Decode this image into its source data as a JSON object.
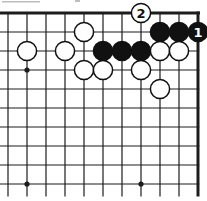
{
  "diagram": {
    "type": "go-board-corner-diagram",
    "colors": {
      "background": "#ffffff",
      "line": "#1c1c1c",
      "black_stone_fill": "#111111",
      "white_stone_fill": "#fefefe",
      "stone_outline": "#111111",
      "black_label_text": "#ffffff",
      "white_label_text": "#111111",
      "artifact_gray": "#bdbdbd"
    },
    "board": {
      "visible_cols": 11,
      "visible_rows": 10,
      "x0": 8,
      "y0": 13,
      "cell": 19,
      "thick_edges": [
        "top",
        "right"
      ],
      "cut_edges": [
        "left",
        "bottom"
      ],
      "line_width_thin": 1.2,
      "line_width_thick": 3,
      "stone_radius": 9.6,
      "star_radius": 2.6
    },
    "star_points": [
      {
        "col": 1,
        "row": 3
      },
      {
        "col": 1,
        "row": 9
      },
      {
        "col": 7,
        "row": 9
      }
    ],
    "stones": [
      {
        "col": 7,
        "row": 0,
        "color": "white",
        "label": "2"
      },
      {
        "col": 4,
        "row": 1,
        "color": "white",
        "label": ""
      },
      {
        "col": 8,
        "row": 1,
        "color": "black",
        "label": ""
      },
      {
        "col": 9,
        "row": 1,
        "color": "black",
        "label": ""
      },
      {
        "col": 10,
        "row": 1,
        "color": "black",
        "label": "1"
      },
      {
        "col": 1,
        "row": 2,
        "color": "white",
        "label": ""
      },
      {
        "col": 3,
        "row": 2,
        "color": "white",
        "label": ""
      },
      {
        "col": 5,
        "row": 2,
        "color": "black",
        "label": ""
      },
      {
        "col": 6,
        "row": 2,
        "color": "black",
        "label": ""
      },
      {
        "col": 7,
        "row": 2,
        "color": "black",
        "label": ""
      },
      {
        "col": 8,
        "row": 2,
        "color": "white",
        "label": ""
      },
      {
        "col": 9,
        "row": 2,
        "color": "white",
        "label": ""
      },
      {
        "col": 4,
        "row": 3,
        "color": "white",
        "label": ""
      },
      {
        "col": 5,
        "row": 3,
        "color": "white",
        "label": ""
      },
      {
        "col": 7,
        "row": 3,
        "color": "white",
        "label": ""
      },
      {
        "col": 8,
        "row": 4,
        "color": "white",
        "label": ""
      }
    ],
    "move_labels": {
      "white_move": "2",
      "black_move": "1"
    },
    "scan_artifacts": [
      {
        "x": 2,
        "y": 1,
        "w": 38,
        "h": 1.5
      },
      {
        "x": 75,
        "y": 0,
        "w": 5,
        "h": 2
      }
    ]
  }
}
